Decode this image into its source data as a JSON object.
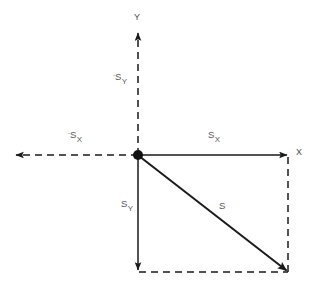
{
  "diagram": {
    "type": "vector-component-diagram",
    "background_color": "#ffffff",
    "stroke_color": "#1a1a1a",
    "label_color": "#58585a",
    "width": 313,
    "height": 294,
    "origin": {
      "x": 138,
      "y": 155
    },
    "axes": {
      "y_axis_label": "Y",
      "x_axis_label": "X",
      "y_axis_style": "dashed",
      "positive_x_style": "solid",
      "negative_x_style": "dashed"
    },
    "labels": {
      "neg_s_y": {
        "sign": "-",
        "base": "S",
        "sub": "Y",
        "text": "-S_Y"
      },
      "neg_s_x": {
        "sign": "-",
        "base": "S",
        "sub": "X",
        "text": "-S_X"
      },
      "pos_s_x": {
        "sign": "",
        "base": "S",
        "sub": "X",
        "text": "S_X"
      },
      "pos_s_y": {
        "sign": "",
        "base": "S",
        "sub": "Y",
        "text": "S_Y"
      },
      "resultant": {
        "sign": "",
        "base": "S",
        "sub": "",
        "text": "S"
      }
    },
    "vectors": [
      {
        "name": "resultant-vector-s",
        "label": "S",
        "from": {
          "x": 138,
          "y": 155
        },
        "to": {
          "x": 288,
          "y": 272
        },
        "style": "solid",
        "arrowhead": true
      },
      {
        "name": "component-vector-sx",
        "label": "S_X",
        "from": {
          "x": 138,
          "y": 155
        },
        "to": {
          "x": 288,
          "y": 155
        },
        "style": "solid",
        "arrowhead": true
      },
      {
        "name": "component-vector-sy",
        "label": "S_Y",
        "from": {
          "x": 138,
          "y": 155
        },
        "to": {
          "x": 138,
          "y": 272
        },
        "style": "solid",
        "arrowhead": true
      }
    ],
    "construction_lines": [
      {
        "name": "projection-line-right",
        "from": {
          "x": 288,
          "y": 155
        },
        "to": {
          "x": 288,
          "y": 272
        },
        "style": "dashed"
      },
      {
        "name": "projection-line-bottom",
        "from": {
          "x": 138,
          "y": 272
        },
        "to": {
          "x": 288,
          "y": 272
        },
        "style": "dashed"
      },
      {
        "name": "negative-y-axis-line",
        "from": {
          "x": 138,
          "y": 155
        },
        "to": {
          "x": 138,
          "y": 32
        },
        "style": "dashed"
      },
      {
        "name": "negative-x-axis-line",
        "from": {
          "x": 138,
          "y": 155
        },
        "to": {
          "x": 14,
          "y": 155
        },
        "style": "dashed"
      }
    ]
  }
}
